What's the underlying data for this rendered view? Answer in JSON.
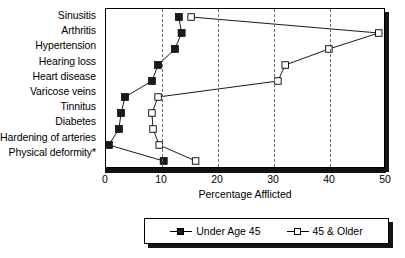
{
  "chart_data": {
    "type": "line",
    "title": "",
    "xlabel": "Percentage Afflicted",
    "ylabel": "",
    "xlim": [
      0,
      50
    ],
    "xticks": [
      0,
      10,
      20,
      30,
      40,
      50
    ],
    "gridlines": [
      10,
      20,
      30,
      40
    ],
    "grid": "vertical-dashed",
    "orientation": "horizontal-categories",
    "legend_position": "bottom-center",
    "categories": [
      "Sinusitis",
      "Arthritis",
      "Hypertension",
      "Hearing loss",
      "Heart disease",
      "Varicose veins",
      "Tinnitus",
      "Diabetes",
      "Hardening of arteries",
      "Physical deformity*"
    ],
    "series": [
      {
        "name": "Under Age 45",
        "marker": "filled-square",
        "color": "#1a1a1a",
        "values": [
          13.0,
          13.5,
          12.3,
          9.3,
          8.2,
          3.4,
          2.7,
          2.3,
          0.5,
          10.3
        ]
      },
      {
        "name": "45 & Older",
        "marker": "open-square",
        "color": "#ffffff",
        "values": [
          15.2,
          48.7,
          39.8,
          32.0,
          30.7,
          9.3,
          8.2,
          8.4,
          9.5,
          16.0
        ]
      }
    ]
  },
  "legend": {
    "entries": [
      {
        "label": "Under Age 45",
        "marker": "filled-square"
      },
      {
        "label": "45 & Older",
        "marker": "open-square"
      }
    ]
  },
  "footnote": "*"
}
